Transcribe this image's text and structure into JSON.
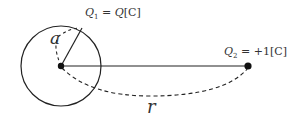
{
  "diagram": {
    "title": "",
    "sphere": {
      "center": [
        61,
        66
      ],
      "radius": 40,
      "radius_label": "a"
    },
    "charge1": {
      "name": "Q",
      "sub": "1",
      "eq": " = ",
      "value": "Q",
      "unit": "[C]"
    },
    "charge2": {
      "name": "Q",
      "sub": "2",
      "eq": " = ",
      "value": "+1",
      "unit": "[C]",
      "position": [
        248,
        66
      ]
    },
    "distance_label": "r",
    "colors": {
      "stroke": "#222222",
      "text": "#333333",
      "background": "#ffffff"
    }
  }
}
